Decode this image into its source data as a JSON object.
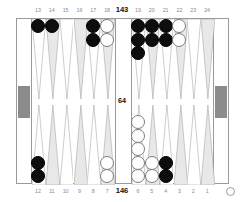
{
  "board": {
    "frame_color": "#9a9a9a",
    "triangle_light": "#ffffff",
    "triangle_shaded": "#e8e8e8",
    "triangle_outline": "#9a9a9a",
    "tray_slot_color": "#8c8c8c",
    "black_checker_color": "#0d0d0d",
    "white_checker_color": "#ffffff"
  },
  "scores": {
    "top_pip_count": "143",
    "bottom_pip_count": "146",
    "bar_value": "64"
  },
  "turn_indicator": {
    "name": "white-to-move-marker",
    "glyph": "O"
  },
  "point_labels": {
    "top": [
      "13",
      "14",
      "15",
      "16",
      "17",
      "18",
      "19",
      "20",
      "21",
      "22",
      "23",
      "24"
    ],
    "bottom": [
      "12",
      "11",
      "10",
      "9",
      "8",
      "7",
      "6",
      "5",
      "4",
      "3",
      "2",
      "1"
    ]
  },
  "points": [
    {
      "number": "13",
      "quadrant": "top-left",
      "slot": 0,
      "color": "black",
      "count": 1
    },
    {
      "number": "14",
      "quadrant": "top-left",
      "slot": 1,
      "color": "black",
      "count": 1
    },
    {
      "number": "15",
      "quadrant": "top-left",
      "slot": 2,
      "color": "none",
      "count": 0
    },
    {
      "number": "16",
      "quadrant": "top-left",
      "slot": 3,
      "color": "none",
      "count": 0
    },
    {
      "number": "17",
      "quadrant": "top-left",
      "slot": 4,
      "color": "black",
      "count": 2
    },
    {
      "number": "18",
      "quadrant": "top-left",
      "slot": 5,
      "color": "white",
      "count": 2
    },
    {
      "number": "19",
      "quadrant": "top-right",
      "slot": 0,
      "color": "black",
      "count": 3
    },
    {
      "number": "20",
      "quadrant": "top-right",
      "slot": 1,
      "color": "black",
      "count": 2
    },
    {
      "number": "21",
      "quadrant": "top-right",
      "slot": 2,
      "color": "black",
      "count": 2
    },
    {
      "number": "22",
      "quadrant": "top-right",
      "slot": 3,
      "color": "white",
      "count": 2
    },
    {
      "number": "23",
      "quadrant": "top-right",
      "slot": 4,
      "color": "none",
      "count": 0
    },
    {
      "number": "24",
      "quadrant": "top-right",
      "slot": 5,
      "color": "none",
      "count": 0
    },
    {
      "number": "12",
      "quadrant": "bottom-left",
      "slot": 0,
      "color": "black",
      "count": 2
    },
    {
      "number": "11",
      "quadrant": "bottom-left",
      "slot": 1,
      "color": "none",
      "count": 0
    },
    {
      "number": "10",
      "quadrant": "bottom-left",
      "slot": 2,
      "color": "none",
      "count": 0
    },
    {
      "number": "9",
      "quadrant": "bottom-left",
      "slot": 3,
      "color": "none",
      "count": 0
    },
    {
      "number": "8",
      "quadrant": "bottom-left",
      "slot": 4,
      "color": "none",
      "count": 0
    },
    {
      "number": "7",
      "quadrant": "bottom-left",
      "slot": 5,
      "color": "white",
      "count": 2
    },
    {
      "number": "6",
      "quadrant": "bottom-right",
      "slot": 0,
      "color": "white",
      "count": 5
    },
    {
      "number": "5",
      "quadrant": "bottom-right",
      "slot": 1,
      "color": "white",
      "count": 2
    },
    {
      "number": "4",
      "quadrant": "bottom-right",
      "slot": 2,
      "color": "black",
      "count": 2
    },
    {
      "number": "3",
      "quadrant": "bottom-right",
      "slot": 3,
      "color": "none",
      "count": 0
    },
    {
      "number": "2",
      "quadrant": "bottom-right",
      "slot": 4,
      "color": "none",
      "count": 0
    },
    {
      "number": "1",
      "quadrant": "bottom-right",
      "slot": 5,
      "color": "none",
      "count": 0
    }
  ]
}
